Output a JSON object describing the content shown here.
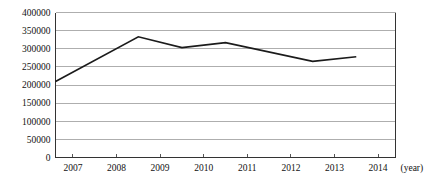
{
  "chart_data": {
    "type": "line",
    "title": "",
    "subtitle": "",
    "xlabel": "(year)",
    "ylabel": "",
    "grid": "horizontal",
    "legend": "none",
    "xlim": [
      2006.6,
      2014.4
    ],
    "ylim": [
      0,
      400000
    ],
    "x_tick_labels": [
      "2007",
      "2008",
      "2009",
      "2010",
      "2011",
      "2012",
      "2013",
      "2014"
    ],
    "x_tick_values": [
      2007,
      2008,
      2009,
      2010,
      2011,
      2012,
      2013,
      2014
    ],
    "y_tick_labels": [
      "0",
      "50000",
      "100000",
      "150000",
      "200000",
      "250000",
      "300000",
      "350000",
      "400000"
    ],
    "y_tick_values": [
      0,
      50000,
      100000,
      150000,
      200000,
      250000,
      300000,
      350000,
      400000
    ],
    "series": [
      {
        "name": "value",
        "color": "#1b1b1b",
        "x": [
          2006.6,
          2008.5,
          2009.5,
          2010.5,
          2012.5,
          2013.5
        ],
        "values": [
          210000,
          333000,
          303000,
          317000,
          265000,
          278000
        ]
      }
    ],
    "annotations": []
  },
  "axis": {
    "unit_label": "(year)",
    "grid_color": "#9a9a9a",
    "axis_color": "#333333",
    "line_color": "#1b1b1b"
  }
}
